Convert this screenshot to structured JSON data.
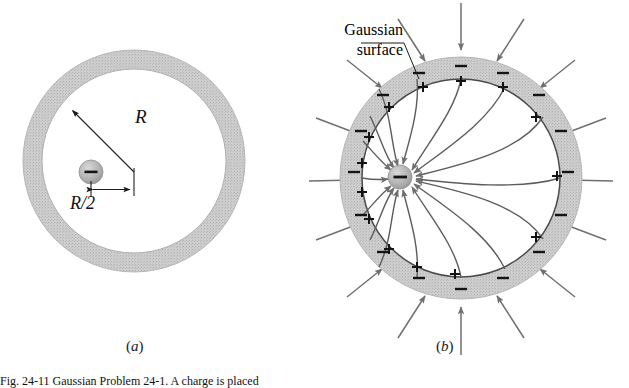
{
  "figure": {
    "type": "physics-diagram",
    "caption_visible_fragment": "Fig. 24-11  Gaussian Problem 24-1. A charge is placed",
    "colors": {
      "shell_fill": "#c9c9c9",
      "shell_edge": "#9a9a9a",
      "field_line": "#6f6f6f",
      "outline": "#555555",
      "sphere_fill": "#b4b4b4",
      "sign_color": "#111111",
      "background": "#ffffff",
      "text": "#111111"
    },
    "panels": [
      {
        "id": "a",
        "label": "(a)",
        "label_letter": "a",
        "description": "Neutral conducting spherical shell with an isolated negative point charge inside, offset from the centre",
        "center": {
          "x": 134,
          "y": 161
        },
        "outer_radius": 111,
        "inner_radius": 92,
        "charge": {
          "name": "negative-point-charge",
          "sign": "−",
          "x": 91,
          "y": 172,
          "radius": 12
        },
        "dimensions": [
          {
            "name": "radius-R",
            "label": "R",
            "from": {
              "x": 134,
              "y": 172
            },
            "to": {
              "x": 69,
              "y": 107
            },
            "arrowheads": "one-ended"
          },
          {
            "name": "offset-R-over-2",
            "label": "R/2",
            "label_numerator": "R",
            "label_denominator": "2",
            "from": {
              "x": 91,
              "y": 189
            },
            "to": {
              "x": 134,
              "y": 189
            },
            "arrowheads": "double-ended"
          }
        ]
      },
      {
        "id": "b",
        "label": "(b)",
        "label_letter": "b",
        "description": "Same shell showing induced positive charge on the inner surface, induced negative charge on the outer surface, the Gaussian surface, and the electric field lines",
        "center": {
          "x": 461,
          "y": 178
        },
        "outer_radius": 121,
        "inner_radius": 99,
        "charge": {
          "name": "negative-point-charge",
          "sign": "−",
          "x": 400,
          "y": 177,
          "radius": 12
        },
        "annotation": {
          "name": "gaussian-surface-label",
          "line1": "Gaussian",
          "line2": "surface",
          "leader_from": {
            "x": 404,
            "y": 43
          },
          "leader_to": {
            "x": 419,
            "y": 78
          }
        },
        "inner_surface_charge": {
          "sign": "+",
          "count": 14,
          "description": "induced positive charge on the inner wall of the shell"
        },
        "outer_surface_charge": {
          "sign": "−",
          "count": 16,
          "description": "induced negative charge spread uniformly on the outer wall of the shell"
        },
        "external_field": {
          "count": 16,
          "direction": "inward",
          "description": "uniform radial field lines pointing toward the shell"
        },
        "internal_field": {
          "count": 14,
          "direction": "toward the point charge",
          "description": "curved field lines running from the inner surface to the off-centre negative charge"
        }
      }
    ]
  }
}
